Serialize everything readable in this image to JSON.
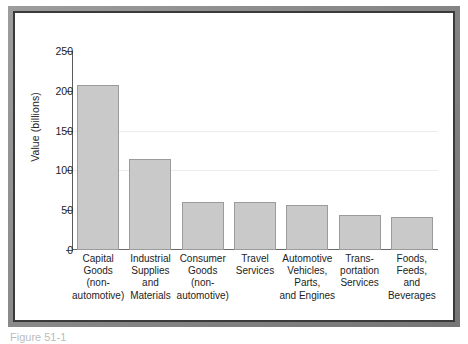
{
  "figure": {
    "frame_color": "#3a3a3a",
    "background": "#ffffff",
    "caption_partial": "Figure 51-1"
  },
  "chart_data": {
    "type": "bar",
    "title": "",
    "xlabel": "",
    "ylabel": "Value (billions)",
    "ylim": [
      0,
      250
    ],
    "yticks": [
      0,
      50,
      100,
      150,
      200,
      250
    ],
    "ytick_labels": [
      "0",
      "50",
      "100",
      "150",
      "200",
      "250"
    ],
    "grid": true,
    "legend": "none",
    "bar_color": "#c9c9c9",
    "bar_edge_color": "#9b9b9b",
    "categories": [
      "Capital Goods (non-automotive)",
      "Industrial Supplies and Materials",
      "Consumer Goods (non-automotive)",
      "Travel Services",
      "Automotive Vehicles, Parts, and Engines",
      "Transportation Services",
      "Foods, Feeds, and Beverages"
    ],
    "category_lines": [
      [
        "Capital",
        "Goods",
        "(non-",
        "automotive)"
      ],
      [
        "Industrial",
        "Supplies",
        "and",
        "Materials"
      ],
      [
        "Consumer",
        "Goods",
        "(non-",
        "automotive)"
      ],
      [
        "Travel",
        "Services"
      ],
      [
        "Automotive",
        "Vehicles,",
        "Parts,",
        "and Engines"
      ],
      [
        "Trans-",
        "portation",
        "Services"
      ],
      [
        "Foods,",
        "Feeds,",
        "and",
        "Beverages"
      ]
    ],
    "values": [
      207,
      114,
      60,
      60,
      57,
      44,
      42
    ]
  }
}
